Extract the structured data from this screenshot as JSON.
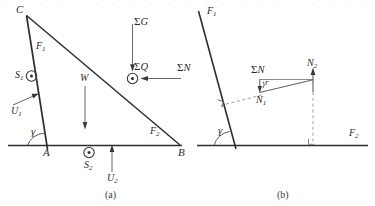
{
  "figure": {
    "caption_a": "(a)",
    "caption_b": "(b)",
    "stroke_color": "#2e2e2e",
    "thin_color": "#6b6b6b",
    "dash_color": "#9a9a9a",
    "background": "#ffffff"
  },
  "diagram_a": {
    "name": "free-body-diagram-wedge",
    "vertices": {
      "C": "C",
      "A": "A",
      "B": "B"
    },
    "labels": {
      "F1": "F",
      "F1_sub": "1",
      "F2": "F",
      "F2_sub": "2",
      "S1": "S",
      "S1_sub": "1",
      "S2": "S",
      "S2_sub": "2",
      "U1": "U",
      "U1_sub": "1",
      "U2": "U",
      "U2_sub": "2",
      "W": "W",
      "gamma": "γ",
      "sum_G": "Σ",
      "sum_G_var": "G",
      "sum_Q": "Σ",
      "sum_Q_var": "Q",
      "sum_N": "Σ",
      "sum_N_var": "N"
    }
  },
  "diagram_b": {
    "name": "resultant-normal-force-diagram",
    "labels": {
      "F1": "F",
      "F1_sub": "1",
      "F2": "F",
      "F2_sub": "2",
      "N1": "N",
      "N1_sub": "1",
      "N2": "N",
      "N2_sub": "2",
      "r": "r",
      "gamma": "γ",
      "sum_N": "Σ",
      "sum_N_var": "N"
    }
  },
  "top_artifacts": [
    {
      "text": "▫",
      "x": 4
    },
    {
      "text": "‒",
      "x": 22
    },
    {
      "text": "▫",
      "x": 40
    },
    {
      "text": "▫",
      "x": 60
    },
    {
      "text": "‒",
      "x": 78
    },
    {
      "text": "▫",
      "x": 96
    },
    {
      "text": "▫",
      "x": 112
    },
    {
      "text": "‒",
      "x": 130
    },
    {
      "text": "▫",
      "x": 150
    },
    {
      "text": "▫",
      "x": 168
    },
    {
      "text": "‒",
      "x": 186
    },
    {
      "text": "▫",
      "x": 205
    },
    {
      "text": "▫",
      "x": 222
    },
    {
      "text": "‒",
      "x": 240
    },
    {
      "text": "▫",
      "x": 258
    },
    {
      "text": "▫",
      "x": 276
    },
    {
      "text": "‒",
      "x": 294
    },
    {
      "text": "▫",
      "x": 312
    },
    {
      "text": "▫",
      "x": 330
    },
    {
      "text": "‒",
      "x": 348
    },
    {
      "text": "▫",
      "x": 364
    }
  ]
}
